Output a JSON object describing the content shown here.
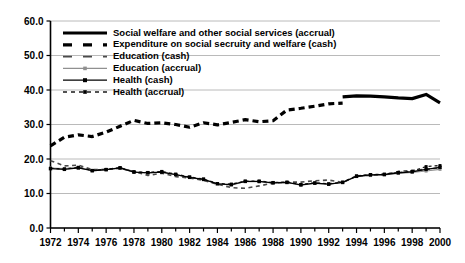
{
  "chart_data": {
    "type": "line",
    "title": "",
    "subtitle": "",
    "xlabel": "",
    "ylabel": "",
    "xlim": [
      1972,
      2000
    ],
    "ylim": [
      0.0,
      60.0
    ],
    "grid": true,
    "legend_position": "top-left",
    "y_ticks": [
      "0.0",
      "10.0",
      "20.0",
      "30.0",
      "40.0",
      "50.0",
      "60.0"
    ],
    "y_tick_values": [
      0.0,
      10.0,
      20.0,
      30.0,
      40.0,
      50.0,
      60.0
    ],
    "x_ticks": [
      "1972",
      "1974",
      "1976",
      "1978",
      "1980",
      "1982",
      "1984",
      "1986",
      "1988",
      "1990",
      "1992",
      "1994",
      "1996",
      "1998",
      "2000"
    ],
    "x_tick_values": [
      1972,
      1974,
      1976,
      1978,
      1980,
      1982,
      1984,
      1986,
      1988,
      1990,
      1992,
      1994,
      1996,
      1998,
      2000
    ],
    "x_minor_values": [
      1973,
      1975,
      1977,
      1979,
      1981,
      1983,
      1985,
      1987,
      1989,
      1991,
      1993,
      1995,
      1997,
      1999
    ],
    "x_all_values": [
      1972,
      1973,
      1974,
      1975,
      1976,
      1977,
      1978,
      1979,
      1980,
      1981,
      1982,
      1983,
      1984,
      1985,
      1986,
      1987,
      1988,
      1989,
      1990,
      1991,
      1992,
      1993,
      1994,
      1995,
      1996,
      1997,
      1998,
      1999,
      2000
    ],
    "series": [
      {
        "name": "Social welfare and other social services (accrual)",
        "style": "thick-solid",
        "color": "#000000",
        "x": [
          1993,
          1994,
          1995,
          1996,
          1997,
          1998,
          1999,
          2000
        ],
        "values": [
          38.0,
          38.3,
          38.2,
          38.0,
          37.7,
          37.5,
          38.7,
          36.3
        ]
      },
      {
        "name": "Expenditure on  social secruity  and welfare (cash)",
        "style": "thick-dashed",
        "color": "#000000",
        "x": [
          1972,
          1973,
          1974,
          1975,
          1976,
          1977,
          1978,
          1979,
          1980,
          1981,
          1982,
          1983,
          1984,
          1985,
          1986,
          1987,
          1988,
          1989,
          1990,
          1991,
          1992,
          1993
        ],
        "values": [
          23.8,
          26.3,
          27.0,
          26.5,
          27.8,
          29.5,
          31.2,
          30.3,
          30.5,
          30.0,
          29.2,
          30.5,
          29.9,
          30.6,
          31.4,
          30.8,
          31.1,
          34.2,
          34.7,
          35.3,
          36.0,
          36.2
        ]
      },
      {
        "name": "Education (cash)",
        "style": "thin-dashed",
        "color": "#555555",
        "x": [
          1972,
          1973,
          1974,
          1975,
          1976,
          1977,
          1978,
          1979,
          1980,
          1981,
          1982,
          1983,
          1984,
          1985,
          1986,
          1987,
          1988,
          1989,
          1990,
          1991,
          1992,
          1993,
          1994,
          1995,
          1996,
          1997,
          1998,
          1999,
          2000
        ],
        "values": [
          19.5,
          18.0,
          18.2,
          16.9,
          17.0,
          17.3,
          16.4,
          15.2,
          15.9,
          14.9,
          14.5,
          13.8,
          12.7,
          11.7,
          11.5,
          12.2,
          13.0,
          13.3,
          13.3,
          13.7,
          13.9,
          13.2,
          15.0,
          15.3,
          15.5,
          16.4,
          16.7,
          17.0,
          17.5
        ]
      },
      {
        "name": "Education (accrual)",
        "style": "thin-solid-marker",
        "color": "#808080",
        "x": [
          1972,
          1973,
          1974,
          1975,
          1976,
          1977,
          1978,
          1979,
          1980,
          1981,
          1982,
          1983,
          1984,
          1985,
          1986,
          1987,
          1988,
          1989,
          1990,
          1991,
          1992,
          1993,
          1994,
          1995,
          1996,
          1997,
          1998,
          1999,
          2000
        ],
        "values": [
          17.4,
          17.2,
          17.5,
          16.6,
          16.9,
          17.3,
          16.2,
          16.0,
          16.2,
          15.5,
          14.6,
          14.0,
          12.9,
          12.4,
          13.5,
          13.4,
          13.0,
          13.2,
          12.4,
          12.9,
          12.7,
          13.2,
          14.9,
          15.2,
          15.4,
          15.8,
          16.1,
          16.5,
          17.0
        ]
      },
      {
        "name": "Health (cash)",
        "style": "solid-square",
        "color": "#000000",
        "x": [
          1972,
          1973,
          1974,
          1975,
          1976,
          1977,
          1978,
          1979,
          1980,
          1981,
          1982,
          1983,
          1984,
          1985,
          1986,
          1987,
          1988,
          1989,
          1990,
          1991,
          1992,
          1993,
          1994,
          1995,
          1996,
          1997,
          1998,
          1999,
          2000
        ],
        "values": [
          17.2,
          17.0,
          17.4,
          16.6,
          16.9,
          17.4,
          16.2,
          16.0,
          16.2,
          15.5,
          14.7,
          14.1,
          12.8,
          12.6,
          13.5,
          13.5,
          13.1,
          13.2,
          12.5,
          13.0,
          12.7,
          13.2,
          15.0,
          15.4,
          15.5,
          16.0,
          16.3,
          17.0,
          17.6
        ]
      },
      {
        "name": "Health (accrual)",
        "style": "dashed-square",
        "color": "#000000",
        "x": [
          1972,
          1973,
          1974,
          1975,
          1976,
          1977,
          1978,
          1979,
          1980,
          1981,
          1982,
          1983,
          1984,
          1985,
          1986,
          1987,
          1988,
          1989,
          1990,
          1991,
          1992,
          1993,
          1994,
          1995,
          1996,
          1997,
          1998,
          1999,
          2000
        ],
        "values": [
          17.3,
          17.1,
          17.6,
          16.7,
          17.0,
          17.5,
          16.3,
          16.1,
          16.4,
          15.6,
          14.8,
          14.2,
          12.9,
          12.7,
          13.6,
          13.6,
          13.2,
          13.3,
          12.6,
          13.1,
          12.8,
          13.3,
          15.1,
          15.5,
          15.6,
          16.1,
          16.4,
          17.8,
          18.1
        ]
      }
    ]
  },
  "legend": {
    "items": [
      {
        "label": "Social welfare and other social services (accrual)",
        "style": "thick-solid"
      },
      {
        "label": "Expenditure on  social secruity  and welfare (cash)",
        "style": "thick-dashed"
      },
      {
        "label": "Education (cash)",
        "style": "thin-dashed"
      },
      {
        "label": "Education (accrual)",
        "style": "thin-solid-marker"
      },
      {
        "label": "Health (cash)",
        "style": "solid-square"
      },
      {
        "label": "Health (accrual)",
        "style": "dashed-square"
      }
    ]
  },
  "colors": {
    "axis": "#000000",
    "grid": "#a8a8a8",
    "background": "#ffffff",
    "series_dark": "#000000",
    "series_gray": "#808080"
  }
}
